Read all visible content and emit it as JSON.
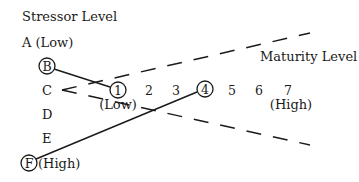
{
  "diagram": {
    "y_axis_title": "Stressor Level",
    "x_axis_title": "Maturity Level",
    "stressor_levels": [
      {
        "label": "A (Low)",
        "circled": false
      },
      {
        "label": "B",
        "circled": true
      },
      {
        "label": "C",
        "circled": false
      },
      {
        "label": "D",
        "circled": false
      },
      {
        "label": "E",
        "circled": false
      },
      {
        "label": "F",
        "circled": true,
        "suffix": "(High)"
      }
    ],
    "maturity_levels": [
      {
        "label": "1",
        "circled": true,
        "sub": "(Low)"
      },
      {
        "label": "2",
        "circled": false
      },
      {
        "label": "3",
        "circled": false
      },
      {
        "label": "4",
        "circled": true
      },
      {
        "label": "5",
        "circled": false
      },
      {
        "label": "6",
        "circled": false
      },
      {
        "label": "7",
        "circled": false,
        "sub": "(High)"
      }
    ],
    "connections": [
      {
        "from": "B",
        "to": "1",
        "style": "solid"
      },
      {
        "from": "F",
        "to": "4",
        "style": "solid"
      }
    ],
    "wedge": {
      "origin": "C",
      "style": "dashed",
      "glyph": "<"
    },
    "colors": {
      "ink": "#1a1a1a",
      "background": "#ffffff"
    }
  }
}
